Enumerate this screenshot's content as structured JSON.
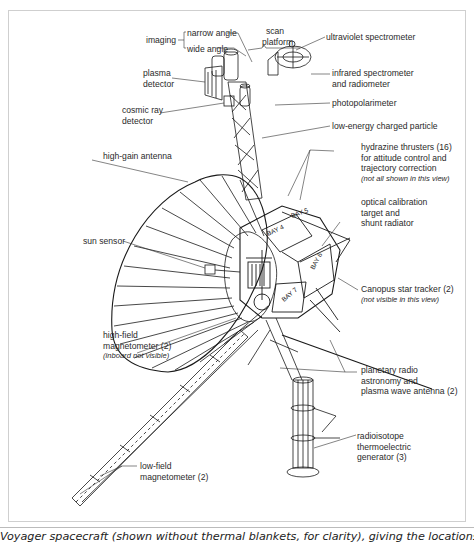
{
  "figure": {
    "title": "Voyager spacecraft",
    "caption": "Voyager spacecraft (shown without thermal blankets, for clarity), giving the locations of most of the external science",
    "bay_labels": [
      "BAY 4",
      "BAY 5",
      "BAY 6",
      "BAY 7"
    ]
  },
  "labels": {
    "imaging": "imaging",
    "narrow_angle": "narrow angle",
    "wide_angle": "wide angle",
    "scan_platform": [
      "scan",
      "platform"
    ],
    "ultraviolet_spectrometer": "ultraviolet spectrometer",
    "infrared_spectrometer": [
      "infrared spectrometer",
      "and radiometer"
    ],
    "plasma_detector": [
      "plasma",
      "detector"
    ],
    "photopolarimeter": "photopolarimeter",
    "cosmic_ray_detector": [
      "cosmic ray",
      "detector"
    ],
    "low_energy_charged_particle": "low-energy charged particle",
    "high_gain_antenna": "high-gain antenna",
    "hydrazine_thrusters": [
      "hydrazine thrusters (16)",
      "for attitude control and",
      "trajectory correction"
    ],
    "hydrazine_thrusters_note": "(not all shown in this view)",
    "optical_calibration": [
      "optical calibration",
      "target and",
      "shunt radiator"
    ],
    "sun_sensor": "sun sensor",
    "canopus_star_tracker": "Canopus star tracker (2)",
    "canopus_star_tracker_note": "(not visible in this view)",
    "high_field_magnetometer": [
      "high-field",
      "magnetometer (2)"
    ],
    "high_field_magnetometer_note": "(inboard not visible)",
    "planetary_radio": [
      "planetary radio",
      "astronomy and",
      "plasma wave antenna (2)"
    ],
    "rtg": [
      "radioisotope",
      "thermoelectric",
      "generator (3)"
    ],
    "low_field_magnetometer": [
      "low-field",
      "magnetometer (2)"
    ]
  },
  "colors": {
    "line": "#1a1a1a",
    "frame": "#cfcfcf",
    "text": "#2a2a2a"
  }
}
